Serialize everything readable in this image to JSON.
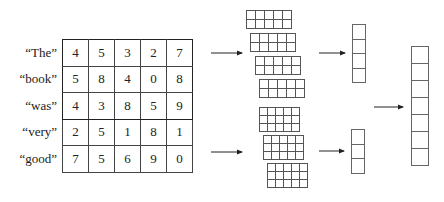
{
  "words": [
    "“The”",
    "“book”",
    "“was”",
    "“very”",
    "“good”"
  ],
  "matrix": [
    [
      "4",
      "5",
      "3",
      "2",
      "7"
    ],
    [
      "5",
      "8",
      "4",
      "0",
      "8"
    ],
    [
      "4",
      "3",
      "8",
      "5",
      "9"
    ],
    [
      "2",
      "5",
      "1",
      "8",
      "1"
    ],
    [
      "7",
      "5",
      "6",
      "9",
      "0"
    ]
  ],
  "filter_groups": [
    {
      "name": "region-size-2",
      "rows": 2,
      "cols": 5,
      "count": 4,
      "output_length": 4
    },
    {
      "name": "region-size-3",
      "rows": 3,
      "cols": 5,
      "count": 3,
      "output_length": 3
    }
  ],
  "concatenated_vector_length": 7,
  "colors": {
    "line": "#444444",
    "background": "#ffffff",
    "text": "#222222"
  }
}
